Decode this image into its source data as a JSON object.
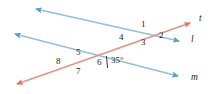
{
  "figure": {
    "type": "geometry-diagram",
    "background": "#ffffff",
    "colors": {
      "parallel_lines": "#7ab3d4",
      "transversal": "#e8816a",
      "label_text": "#231f20",
      "tick_mark": "#231f20"
    },
    "lines": [
      {
        "name": "l",
        "label": "l",
        "color": "#7ab3d4",
        "role": "parallel-line-upper",
        "arrow_start": true,
        "arrow_end": true,
        "x1": 36,
        "y1": 9,
        "x2": 179,
        "y2": 41
      },
      {
        "name": "m",
        "label": "m",
        "color": "#7ab3d4",
        "role": "parallel-line-lower",
        "arrow_start": true,
        "arrow_end": true,
        "x1": 15,
        "y1": 34,
        "x2": 178,
        "y2": 76
      },
      {
        "name": "t",
        "label": "t",
        "color": "#e8816a",
        "role": "transversal",
        "arrow_start": true,
        "arrow_end": true,
        "x1": 17,
        "y1": 84,
        "x2": 190,
        "y2": 23
      }
    ],
    "intersections": [
      {
        "name": "upper",
        "x": 146,
        "y": 36,
        "lines": [
          "t",
          "l"
        ]
      },
      {
        "name": "lower",
        "x": 80,
        "y": 65,
        "lines": [
          "t",
          "m"
        ]
      }
    ],
    "angle_labels": [
      {
        "id": "1",
        "text": "1",
        "x": 143,
        "y": 24,
        "at": "upper"
      },
      {
        "id": "2",
        "text": "2",
        "x": 160,
        "y": 34,
        "at": "upper"
      },
      {
        "id": "3",
        "text": "3",
        "x": 143,
        "y": 40,
        "at": "upper"
      },
      {
        "id": "4",
        "text": "4",
        "x": 121,
        "y": 35,
        "at": "upper"
      },
      {
        "id": "5",
        "text": "5",
        "x": 78,
        "y": 52,
        "at": "lower"
      },
      {
        "id": "6",
        "text": "6",
        "x": 96,
        "y": 62,
        "at": "lower"
      },
      {
        "id": "7",
        "text": "7",
        "x": 78,
        "y": 68,
        "at": "lower"
      },
      {
        "id": "8",
        "text": "8",
        "x": 58,
        "y": 60,
        "at": "lower"
      }
    ],
    "measures": [
      {
        "id": "angle-35",
        "text": "35°",
        "value": 35,
        "unit": "degrees",
        "x": 110,
        "y": 57,
        "at": "lower",
        "tick_mark": {
          "x1": 106,
          "y1": 57,
          "x2": 107,
          "y2": 68
        }
      }
    ],
    "line_name_labels": [
      {
        "id": "t",
        "text": "t",
        "x": 198,
        "y": 18
      },
      {
        "id": "l",
        "text": "l",
        "x": 190,
        "y": 39
      },
      {
        "id": "m",
        "text": "m",
        "x": 190,
        "y": 77
      }
    ]
  }
}
